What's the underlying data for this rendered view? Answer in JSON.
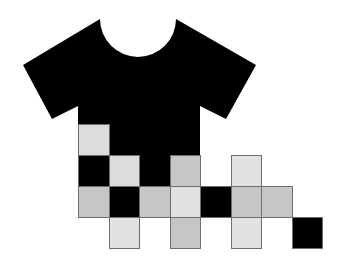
{
  "graphic": {
    "subject": "t-shirt dissolving into pixel squares",
    "colors": {
      "shirt": "#000000",
      "background": "#ffffff",
      "cell_border": "#6e6e6e",
      "black": "#000000",
      "light": "#dcdcdc",
      "mid": "#c6c6c6",
      "pale": "#e2e2e2"
    },
    "shirt_path": "M23,65 L100,19 A38,38 0 0 0 176,19 L256,65 L226,119 L200,106 L200,186 L78,186 L78,106 L52,119 Z",
    "grid": {
      "origin_x": 78,
      "origin_y": 124,
      "cell_w": 30.5,
      "cell_h": 31,
      "cells": [
        {
          "row": 0,
          "col": 0,
          "tone": "light"
        },
        {
          "row": 1,
          "col": 0,
          "tone": "black"
        },
        {
          "row": 1,
          "col": 1,
          "tone": "light"
        },
        {
          "row": 1,
          "col": 3,
          "tone": "mid"
        },
        {
          "row": 1,
          "col": 5,
          "tone": "pale"
        },
        {
          "row": 2,
          "col": 0,
          "tone": "mid"
        },
        {
          "row": 2,
          "col": 1,
          "tone": "black"
        },
        {
          "row": 2,
          "col": 2,
          "tone": "mid"
        },
        {
          "row": 2,
          "col": 3,
          "tone": "pale"
        },
        {
          "row": 2,
          "col": 4,
          "tone": "black"
        },
        {
          "row": 2,
          "col": 5,
          "tone": "mid"
        },
        {
          "row": 2,
          "col": 6,
          "tone": "mid"
        },
        {
          "row": 3,
          "col": 1,
          "tone": "pale"
        },
        {
          "row": 3,
          "col": 3,
          "tone": "mid"
        },
        {
          "row": 3,
          "col": 5,
          "tone": "pale"
        },
        {
          "row": 3,
          "col": 7,
          "tone": "black"
        }
      ]
    }
  }
}
